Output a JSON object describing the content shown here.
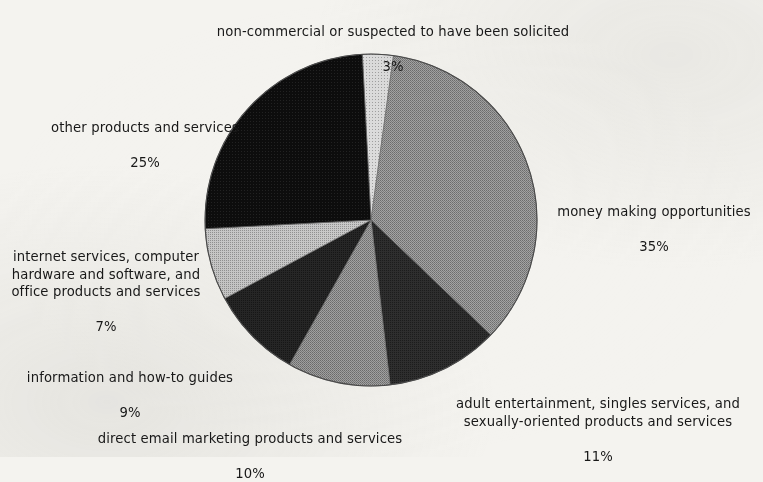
{
  "figure": {
    "background_color": "#f4f3ef",
    "text_color": "#181818"
  },
  "chart_data": {
    "type": "pie",
    "title": "",
    "subtitle": "",
    "xlabel": "",
    "ylabel": "",
    "legend_position": "labels-around-pie",
    "grid": false,
    "units": "percent",
    "total": 100,
    "start_angle_deg": -3,
    "direction": "clockwise",
    "categories": [
      "non-commercial or suspected to have been solicited",
      "money making opportunities",
      "adult entertainment, singles services, and sexually-oriented products and services",
      "direct email marketing products and services",
      "information and how-to guides",
      "internet services, computer hardware and software, and office products and services",
      "other products and services"
    ],
    "values": [
      3,
      35,
      11,
      10,
      9,
      7,
      25
    ],
    "value_labels": [
      "3%",
      "35%",
      "11%",
      "10%",
      "9%",
      "7%",
      "25%"
    ],
    "colors": [
      "#c6c6c6",
      "#8d8d8d",
      "#2a2a2a",
      "#8d8d8d",
      "#232323",
      "#b4b4b4",
      "#101010"
    ],
    "slices": [
      {
        "label": "non-commercial or suspected to have been solicited",
        "label_lines": [
          "non-commercial or suspected to have been solicited"
        ],
        "value": 3,
        "value_label": "3%",
        "color": "#c6c6c6",
        "label_align": "center"
      },
      {
        "label": "money making opportunities",
        "label_lines": [
          "money making opportunities"
        ],
        "value": 35,
        "value_label": "35%",
        "color": "#8d8d8d",
        "label_align": "center"
      },
      {
        "label": "adult entertainment, singles services, and sexually-oriented products and services",
        "label_lines": [
          "adult entertainment, singles services, and",
          "sexually-oriented products and services"
        ],
        "value": 11,
        "value_label": "11%",
        "color": "#2a2a2a",
        "label_align": "center"
      },
      {
        "label": "direct email marketing products and services",
        "label_lines": [
          "direct email marketing products and services"
        ],
        "value": 10,
        "value_label": "10%",
        "color": "#8d8d8d",
        "label_align": "center"
      },
      {
        "label": "information and how-to guides",
        "label_lines": [
          "information and how-to guides"
        ],
        "value": 9,
        "value_label": "9%",
        "color": "#232323",
        "label_align": "center"
      },
      {
        "label": "internet services, computer hardware and software, and office products and services",
        "label_lines": [
          "internet services, computer",
          "hardware and software, and",
          "office products and services"
        ],
        "value": 7,
        "value_label": "7%",
        "color": "#b4b4b4",
        "label_align": "center"
      },
      {
        "label": "other products and services",
        "label_lines": [
          "other products and services"
        ],
        "value": 25,
        "value_label": "25%",
        "color": "#101010",
        "label_align": "center"
      }
    ]
  },
  "labels": {
    "noncommercial": {
      "text": "non-commercial or suspected to have been solicited",
      "value": "3%"
    },
    "other": {
      "text": "other products and services",
      "value": "25%"
    },
    "internet": {
      "text": "internet services, computer\nhardware and software, and\noffice products and services",
      "value": "7%"
    },
    "information": {
      "text": "information and how-to guides",
      "value": "9%"
    },
    "direct": {
      "text": "direct email marketing products and services",
      "value": "10%"
    },
    "adult": {
      "text": "adult entertainment, singles services, and\nsexually-oriented products and services",
      "value": "11%"
    },
    "money": {
      "text": "money making opportunities",
      "value": "35%"
    }
  }
}
